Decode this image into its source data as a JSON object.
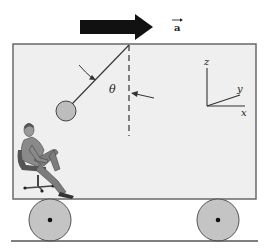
{
  "figure": {
    "acceleration": {
      "label": "a",
      "vector_mark": "→",
      "direction": "right"
    },
    "pendulum": {
      "angle_label": "θ"
    },
    "axes": {
      "z_label": "z",
      "y_label": "y",
      "x_label": "x"
    },
    "colors": {
      "car_fill": "#efefef",
      "car_stroke": "#6a6a6a",
      "wheel_fill": "#c4c4c4",
      "ball_fill": "#bdbdbd",
      "arrow_fill": "#111111",
      "line": "#333333"
    }
  }
}
